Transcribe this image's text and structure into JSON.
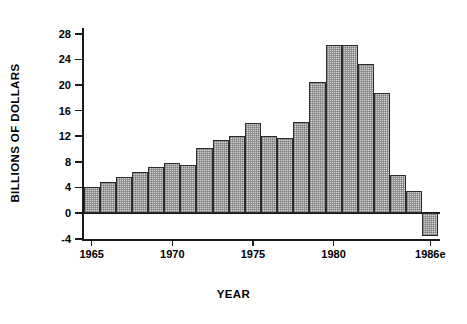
{
  "chart_data": {
    "type": "bar",
    "title": "",
    "xlabel": "YEAR",
    "ylabel": "BILLIONS OF DOLLARS",
    "ylim": [
      -4.2,
      28.9
    ],
    "xlim": [
      1964.4,
      1986.6
    ],
    "grid": false,
    "legend": null,
    "yticks": [
      -4,
      0,
      4,
      8,
      12,
      16,
      20,
      24,
      28
    ],
    "ytick_labels": [
      "-4",
      "0",
      "4",
      "8",
      "12",
      "16",
      "20",
      "24",
      "28"
    ],
    "xticks": [
      1965,
      1970,
      1975,
      1980,
      1986
    ],
    "xtick_labels": [
      "1965",
      "1970",
      "1975",
      "1980",
      "1986e"
    ],
    "categories": [
      "1965",
      "1966",
      "1967",
      "1968",
      "1969",
      "1970",
      "1971",
      "1972",
      "1973",
      "1974",
      "1975",
      "1976",
      "1977",
      "1978",
      "1979",
      "1980",
      "1981",
      "1982",
      "1983",
      "1984",
      "1985",
      "1986e"
    ],
    "values": [
      4.0,
      4.8,
      5.6,
      6.4,
      7.2,
      7.9,
      7.5,
      10.1,
      11.4,
      12.0,
      14.1,
      12.1,
      11.8,
      14.3,
      20.5,
      26.3,
      26.2,
      23.3,
      18.7,
      5.9,
      3.4,
      -3.5
    ],
    "bar_face_color": "#d2d2d2",
    "bar_edge_color": "#2b2b2b",
    "axis_color": "#1a1a1a",
    "background_color": "#ffffff"
  }
}
